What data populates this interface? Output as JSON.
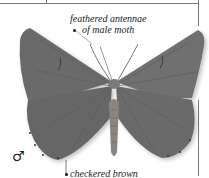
{
  "labels": {
    "antennae_line1": "feathered antennae",
    "antennae_line2": "of male moth",
    "wing_edge": "checkered brown"
  },
  "symbols": {
    "sex": "♂"
  },
  "illustration": {
    "subject": "moth-specimen",
    "wing_color": "#6e6e6e",
    "body_color": "#8a8580"
  }
}
